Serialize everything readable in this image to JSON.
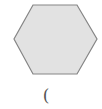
{
  "figure": {
    "shape": "hexagon",
    "fill_color": "#e2e2e2",
    "stroke_color": "#858585",
    "points": "33,5 77,5 97,39 77,74 33,74 14,39"
  },
  "caption": {
    "text": "("
  }
}
